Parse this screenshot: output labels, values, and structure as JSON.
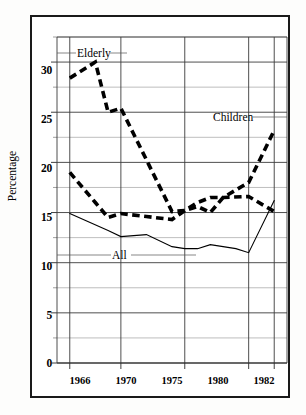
{
  "figure": {
    "ylabel": "Percentage",
    "series_labels": {
      "elderly": "Elderly",
      "children": "Children",
      "all": "All"
    }
  },
  "chart_data": {
    "type": "line",
    "title": "",
    "xlabel": "",
    "ylabel": "Percentage",
    "xlim": [
      1965,
      1983
    ],
    "ylim": [
      0,
      32.5
    ],
    "grid": true,
    "legend_position": "inline-annotations",
    "y_major_ticks": [
      0,
      5,
      10,
      15,
      20,
      25,
      30
    ],
    "y_minor_step": 2.5,
    "x_tick_labels": [
      "1966",
      "1970",
      "1975",
      "1980",
      "1982"
    ],
    "x_tick_values": [
      1966,
      1970,
      1975,
      1980,
      1982
    ],
    "series": [
      {
        "name": "Elderly",
        "style": "bold-dashed",
        "x": [
          1966,
          1968,
          1969,
          1970,
          1974,
          1975,
          1976,
          1977,
          1978,
          1980,
          1982
        ],
        "values": [
          28.4,
          30.0,
          25.0,
          25.4,
          15.1,
          15.2,
          16.0,
          16.5,
          16.5,
          16.6,
          15.1
        ]
      },
      {
        "name": "Children",
        "style": "bold-dashed",
        "x": [
          1966,
          1968,
          1969,
          1970,
          1972,
          1974,
          1975,
          1976,
          1977,
          1978,
          1980,
          1982
        ],
        "values": [
          19.0,
          16.0,
          14.5,
          14.9,
          14.6,
          14.3,
          15.2,
          15.6,
          15.0,
          16.5,
          18.0,
          23.2
        ]
      },
      {
        "name": "All",
        "style": "thin-solid",
        "x": [
          1966,
          1969,
          1970,
          1972,
          1974,
          1975,
          1976,
          1977,
          1979,
          1980,
          1982
        ],
        "values": [
          14.9,
          13.2,
          12.6,
          12.8,
          11.6,
          11.4,
          11.4,
          11.8,
          11.4,
          11.0,
          16.2
        ]
      }
    ]
  },
  "y_ticks": [
    {
      "label": "30",
      "value": 30
    },
    {
      "label": "25",
      "value": 25
    },
    {
      "label": "20",
      "value": 20
    },
    {
      "label": "15",
      "value": 15
    },
    {
      "label": "10",
      "value": 10
    },
    {
      "label": "5",
      "value": 5
    },
    {
      "label": "0",
      "value": 0
    }
  ],
  "x_ticks": [
    {
      "label": "1966",
      "value": 1966
    },
    {
      "label": "1970",
      "value": 1970
    },
    {
      "label": "1975",
      "value": 1975
    },
    {
      "label": "1980",
      "value": 1980
    },
    {
      "label": "1982",
      "value": 1982
    }
  ]
}
